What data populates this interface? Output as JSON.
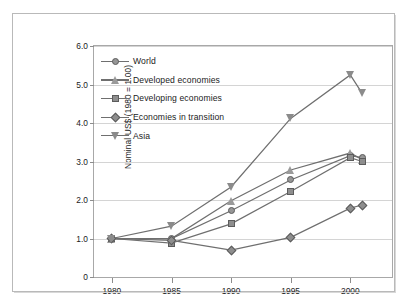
{
  "chart_data": {
    "type": "line",
    "title": "",
    "subtitle": "",
    "xlabel": "",
    "ylabel": "Nominal US$ (1980 = 1.00)",
    "x": [
      1980,
      1985,
      1990,
      1995,
      2000,
      2001
    ],
    "xtick_labels": [
      "1980",
      "1985",
      "1990",
      "1995",
      "2000"
    ],
    "xticks": [
      1980,
      1985,
      1990,
      1995,
      2000
    ],
    "ytick_labels": [
      "0",
      "1.0",
      "2.0",
      "3.0",
      "4.0",
      "5.0",
      "6.0"
    ],
    "yticks": [
      0,
      1.0,
      2.0,
      3.0,
      4.0,
      5.0,
      6.0
    ],
    "xlim": [
      1978.5,
      2003.5
    ],
    "ylim": [
      0,
      6.0
    ],
    "grid": "horizontal",
    "legend_position": "top-left",
    "series": [
      {
        "name": "World",
        "marker": "circle",
        "color": "#969696",
        "values": [
          1.0,
          1.0,
          1.72,
          2.52,
          3.15,
          3.1
        ]
      },
      {
        "name": "Developed economies",
        "marker": "triangle-up",
        "color": "#9a9a9a",
        "values": [
          1.0,
          1.0,
          1.98,
          2.78,
          3.22,
          3.05
        ]
      },
      {
        "name": "Developing economies",
        "marker": "square",
        "color": "#8e8e8e",
        "values": [
          1.0,
          0.88,
          1.38,
          2.22,
          3.1,
          3.0
        ]
      },
      {
        "name": "Economies in transition",
        "marker": "diamond",
        "color": "#8e8e8e",
        "values": [
          1.0,
          0.95,
          0.7,
          1.03,
          1.79,
          1.87
        ]
      },
      {
        "name": "Asia",
        "marker": "triangle-down",
        "color": "#8b8b8b",
        "values": [
          1.0,
          1.32,
          2.34,
          4.12,
          5.25,
          4.77
        ]
      }
    ]
  }
}
